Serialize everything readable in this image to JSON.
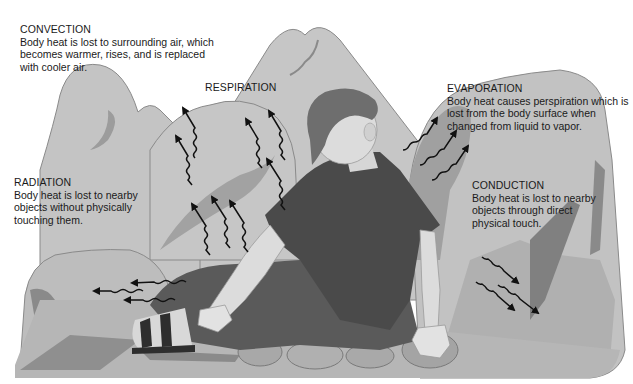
{
  "figure": {
    "labels": [
      {
        "id": "convection",
        "title": "CONVECTION",
        "description": "Body heat is lost to surrounding air, which becomes warmer, rises, and is replaced with cooler air."
      },
      {
        "id": "respiration",
        "title": "RESPIRATION",
        "description": ""
      },
      {
        "id": "evaporation",
        "title": "EVAPORATION",
        "description": "Body heat causes perspiration which is lost from the body surface when changed from liquid to vapor."
      },
      {
        "id": "radiation",
        "title": "RADIATION",
        "description": "Body heat is lost to nearby objects without physically touching them."
      },
      {
        "id": "conduction",
        "title": "CONDUCTION",
        "description": "Body heat is lost to nearby objects through direct physical touch."
      }
    ],
    "arrow_groups": [
      {
        "name": "convection-arrows",
        "count": 4,
        "direction": "up-left"
      },
      {
        "name": "respiration-arrows",
        "count": 3,
        "direction": "up-left"
      },
      {
        "name": "evaporation-arrows",
        "count": 3,
        "direction": "up-right"
      },
      {
        "name": "radiation-arrows",
        "count": 3,
        "direction": "left"
      },
      {
        "name": "conduction-arrows",
        "count": 3,
        "direction": "down-right"
      }
    ],
    "colors": {
      "rock_light": "#c4c4c4",
      "rock_mid": "#a9a9a9",
      "rock_dark": "#7e7e7e",
      "shirt": "#4a4a4a",
      "pants": "#5a5a5a",
      "skin": "#dcdcdc",
      "hair": "#6e6e6e",
      "arrow": "#111111",
      "text": "#1a1a1a"
    }
  }
}
